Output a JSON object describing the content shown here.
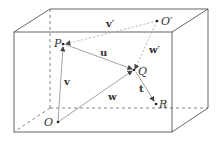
{
  "diagram": {
    "points": [
      {
        "id": "O",
        "label": "O"
      },
      {
        "id": "O_prime",
        "label": "O′"
      },
      {
        "id": "P",
        "label": "P"
      },
      {
        "id": "Q",
        "label": "Q"
      },
      {
        "id": "R",
        "label": "R"
      }
    ],
    "vectors": [
      {
        "id": "v",
        "label": "v",
        "from": "O",
        "to": "P",
        "style": "solid"
      },
      {
        "id": "w",
        "label": "w",
        "from": "O",
        "to": "Q",
        "style": "solid"
      },
      {
        "id": "u",
        "label": "u",
        "from": "P",
        "to": "Q",
        "style": "solid"
      },
      {
        "id": "t",
        "label": "t",
        "from": "Q",
        "to": "R",
        "style": "solid"
      },
      {
        "id": "v_prime",
        "label": "v′",
        "from": "O′",
        "to": "P",
        "style": "dashed"
      },
      {
        "id": "w_prime",
        "label": "w′",
        "from": "O′",
        "to": "Q",
        "style": "dashed"
      }
    ],
    "colors": {
      "edge": "#555555",
      "vector": "#888888",
      "dashed_vector": "#aaaaaa"
    }
  }
}
